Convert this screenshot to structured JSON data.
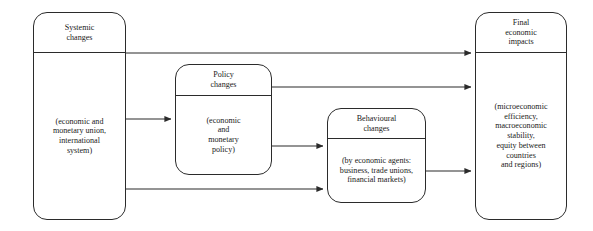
{
  "diagram": {
    "type": "flow-diagram",
    "title": "",
    "background_color": "#ffffff",
    "line_color": "#2b2b2b",
    "nodes": [
      {
        "id": "systemic",
        "header": "Systemic\nchanges",
        "body": "(economic and\nmonetary union,\ninternational\nsystem)"
      },
      {
        "id": "policy",
        "header": "Policy\nchanges",
        "body": "(economic\nand\nmonetary\npolicy)"
      },
      {
        "id": "behavioural",
        "header": "Behavioural\nchanges",
        "body": "(by economic agents:\nbusiness, trade unions,\nfinancial markets)"
      },
      {
        "id": "final",
        "header": "Final\neconomic\nimpacts",
        "body": "(microeconomic\nefficiency,\nmacroeconomic\nstability,\nequity between\ncountries\nand regions)"
      }
    ],
    "edges": [
      {
        "id": "systemic-to-final",
        "from": "systemic",
        "to": "final",
        "label": ""
      },
      {
        "id": "systemic-to-policy",
        "from": "systemic",
        "to": "policy",
        "label": ""
      },
      {
        "id": "systemic-to-behavioural",
        "from": "systemic",
        "to": "behavioural",
        "label": ""
      },
      {
        "id": "policy-to-final",
        "from": "policy",
        "to": "final",
        "label": ""
      },
      {
        "id": "policy-to-behavioural",
        "from": "policy",
        "to": "behavioural",
        "label": ""
      },
      {
        "id": "behavioural-to-final",
        "from": "behavioural",
        "to": "final",
        "label": ""
      }
    ]
  }
}
